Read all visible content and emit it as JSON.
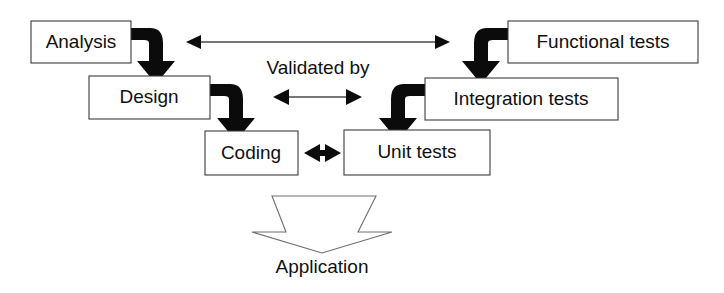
{
  "diagram": {
    "background_color": "#ffffff",
    "box_fill": "#ffffff",
    "box_border_color": "#3b3b3b",
    "arrow_color": "#0b0b0b",
    "thin_arrow_color": "#4a4a4a",
    "chevron_outline_color": "#6e6e6e",
    "text_color": "#101010"
  },
  "boxes": [
    {
      "id": "analysis",
      "label": "Analysis",
      "x": 31,
      "y": 21,
      "w": 100,
      "h": 42
    },
    {
      "id": "design",
      "label": "Design",
      "x": 89,
      "y": 76,
      "w": 121,
      "h": 43
    },
    {
      "id": "coding",
      "label": "Coding",
      "x": 205,
      "y": 131,
      "w": 93,
      "h": 44
    },
    {
      "id": "unit-tests",
      "label": "Unit tests",
      "x": 344,
      "y": 130,
      "w": 146,
      "h": 45
    },
    {
      "id": "integration-tests",
      "label": "Integration tests",
      "x": 425,
      "y": 78,
      "w": 193,
      "h": 42
    },
    {
      "id": "functional-tests",
      "label": "Functional tests",
      "x": 508,
      "y": 21,
      "w": 190,
      "h": 42
    }
  ],
  "labels": [
    {
      "id": "validated-by",
      "text": "Validated by",
      "x": 318,
      "y": 69
    },
    {
      "id": "application",
      "text": "Application",
      "x": 322,
      "y": 268
    }
  ],
  "connectors": {
    "validated_by_top": {
      "id": "validated-by-top-arrow",
      "x1": 188,
      "x2": 448,
      "y": 42,
      "double_headed": true
    },
    "validated_by_middle": {
      "id": "validated-by-middle-arrow",
      "x1": 275,
      "x2": 360,
      "y": 97,
      "double_headed": true
    },
    "coding_unit": {
      "id": "coding-unit-tests-arrow",
      "x1": 305,
      "x2": 340,
      "y": 153,
      "double_headed": true
    }
  },
  "flow_arrows": [
    {
      "id": "analysis-to-design",
      "from": "analysis",
      "to": "design"
    },
    {
      "id": "design-to-coding",
      "from": "design",
      "to": "coding"
    },
    {
      "id": "functional-to-integration",
      "from": "functional-tests",
      "to": "integration-tests"
    },
    {
      "id": "integration-to-unit",
      "from": "integration-tests",
      "to": "unit-tests"
    }
  ],
  "output_chevron": {
    "id": "application-chevron",
    "points": "272,196 376,196 358,232 392,232 322,253 252,232 286,232"
  }
}
